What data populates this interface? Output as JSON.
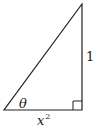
{
  "diagram": {
    "type": "right-triangle",
    "labels": {
      "angle": "θ",
      "vertical_side": "1",
      "base_variable": "x",
      "base_exponent": "2"
    },
    "colors": {
      "stroke": "#222222",
      "background": "#ffffff"
    }
  }
}
